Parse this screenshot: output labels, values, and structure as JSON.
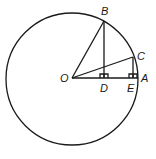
{
  "diagram": {
    "type": "geometry",
    "stroke_color": "#1a1a1a",
    "points": {
      "O": {
        "label": "O",
        "x": 72,
        "y": 78
      },
      "A": {
        "label": "A",
        "x": 137,
        "y": 78
      },
      "B": {
        "label": "B",
        "x": 104,
        "y": 21
      },
      "C": {
        "label": "C",
        "x": 133,
        "y": 58
      },
      "D": {
        "label": "D",
        "x": 104,
        "y": 78
      },
      "E": {
        "label": "E",
        "x": 133,
        "y": 78
      }
    },
    "circle": {
      "center": "O",
      "radius": 65
    },
    "segments": [
      "OA",
      "OB",
      "OC",
      "BD",
      "CE"
    ],
    "right_angles": [
      "D",
      "E"
    ]
  }
}
